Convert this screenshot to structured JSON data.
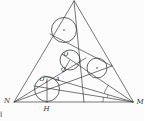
{
  "figure": {
    "type": "geometry-diagram",
    "labels": {
      "vertex_n": "N",
      "vertex_m": "M",
      "foot_h": "H",
      "center_o": "O",
      "center_o1_base": "O",
      "center_o1_sub": "1",
      "point_a": "A"
    },
    "colors": {
      "stroke": "#3c3c3c",
      "background": "#fcfcfc"
    }
  }
}
